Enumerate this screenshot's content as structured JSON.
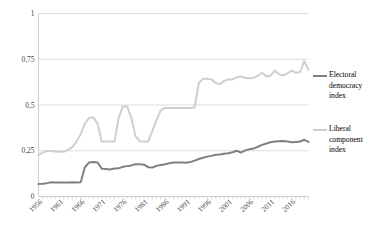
{
  "chart_data": {
    "type": "line",
    "title": "",
    "xlabel": "",
    "ylabel": "",
    "xlim": [
      1955,
      2019
    ],
    "ylim": [
      0,
      1
    ],
    "yticks": [
      0,
      0.25,
      0.5,
      0.75,
      1
    ],
    "ytick_labels": [
      "0",
      "0,25",
      "0,5",
      "0,75",
      "1"
    ],
    "xticks": [
      1956,
      1961,
      1966,
      1971,
      1976,
      1981,
      1986,
      1991,
      1996,
      2001,
      2006,
      2011,
      2016
    ],
    "xtick_labels": [
      "1956",
      "1961",
      "1966",
      "1971",
      "1976",
      "1981",
      "1986",
      "1991",
      "1996",
      "2001",
      "2006",
      "2011",
      "2016"
    ],
    "grid": "horizontal",
    "legend_position": "right",
    "x": [
      1955,
      1956,
      1957,
      1958,
      1959,
      1960,
      1961,
      1962,
      1963,
      1964,
      1965,
      1966,
      1967,
      1968,
      1969,
      1970,
      1971,
      1972,
      1973,
      1974,
      1975,
      1976,
      1977,
      1978,
      1979,
      1980,
      1981,
      1982,
      1983,
      1984,
      1985,
      1986,
      1987,
      1988,
      1989,
      1990,
      1991,
      1992,
      1993,
      1994,
      1995,
      1996,
      1997,
      1998,
      1999,
      2000,
      2001,
      2002,
      2003,
      2004,
      2005,
      2006,
      2007,
      2008,
      2009,
      2010,
      2011,
      2012,
      2013,
      2014,
      2015,
      2016,
      2017,
      2018,
      2019
    ],
    "series": [
      {
        "name": "Electoral democracy index",
        "color": "#808080",
        "values": [
          0.068,
          0.07,
          0.073,
          0.078,
          0.077,
          0.076,
          0.076,
          0.077,
          0.078,
          0.077,
          0.078,
          0.16,
          0.186,
          0.188,
          0.186,
          0.152,
          0.15,
          0.148,
          0.153,
          0.154,
          0.162,
          0.166,
          0.17,
          0.176,
          0.176,
          0.174,
          0.16,
          0.158,
          0.168,
          0.172,
          0.176,
          0.182,
          0.186,
          0.186,
          0.186,
          0.184,
          0.188,
          0.196,
          0.205,
          0.212,
          0.218,
          0.222,
          0.228,
          0.23,
          0.233,
          0.236,
          0.242,
          0.25,
          0.24,
          0.252,
          0.258,
          0.262,
          0.272,
          0.282,
          0.29,
          0.296,
          0.3,
          0.302,
          0.303,
          0.3,
          0.296,
          0.298,
          0.3,
          0.31,
          0.298
        ]
      },
      {
        "name": "Liberal component index",
        "color": "#cfcfcf",
        "values": [
          0.228,
          0.24,
          0.248,
          0.248,
          0.246,
          0.244,
          0.244,
          0.256,
          0.27,
          0.3,
          0.34,
          0.4,
          0.43,
          0.432,
          0.4,
          0.3,
          0.3,
          0.3,
          0.3,
          0.43,
          0.492,
          0.492,
          0.43,
          0.33,
          0.302,
          0.3,
          0.3,
          0.36,
          0.42,
          0.472,
          0.484,
          0.484,
          0.484,
          0.484,
          0.484,
          0.484,
          0.484,
          0.486,
          0.62,
          0.644,
          0.644,
          0.64,
          0.62,
          0.614,
          0.632,
          0.64,
          0.64,
          0.652,
          0.656,
          0.648,
          0.646,
          0.648,
          0.66,
          0.676,
          0.656,
          0.66,
          0.688,
          0.668,
          0.662,
          0.672,
          0.688,
          0.676,
          0.68,
          0.74,
          0.692
        ]
      }
    ]
  },
  "legend": {
    "items": [
      {
        "label_lines": [
          "Electoral",
          "democracy",
          "index"
        ],
        "color": "#808080"
      },
      {
        "label_lines": [
          "Liberal",
          "component",
          "index"
        ],
        "color": "#cfcfcf"
      }
    ],
    "item0_line0": "Electoral",
    "item0_line1": "democracy",
    "item0_line2": "index",
    "item1_line0": "Liberal",
    "item1_line1": "component",
    "item1_line2": "index"
  },
  "axis": {
    "y0": "0",
    "y1": "0,25",
    "y2": "0,5",
    "y3": "0,75",
    "y4": "1",
    "x0": "1956",
    "x1": "1961",
    "x2": "1966",
    "x3": "1971",
    "x4": "1976",
    "x5": "1981",
    "x6": "1986",
    "x7": "1991",
    "x8": "1996",
    "x9": "2001",
    "x10": "2006",
    "x11": "2011",
    "x12": "2016"
  },
  "colors": {
    "series_dark": "#808080",
    "series_light": "#cfcfcf",
    "grid": "#d9d9d9",
    "axis": "#c9c9c9",
    "text": "#3f3f3f"
  }
}
